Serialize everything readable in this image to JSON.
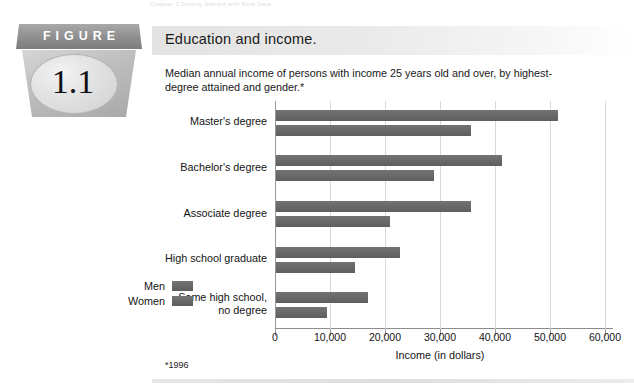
{
  "running_head": "Chapter 1  Getting Started with Real Data",
  "figure_badge": {
    "banner_label": "FIGURE",
    "number": "1.1"
  },
  "title_bar": {
    "title": "Education and income."
  },
  "caption": "Median annual income of persons with income 25 years old and over, by highest-degree attained and gender.*",
  "footnote": "*1996",
  "legend": {
    "items": [
      {
        "label": "Men",
        "color": "#6a6a6a"
      },
      {
        "label": "Women",
        "color": "#6a6a6a"
      }
    ]
  },
  "chart_data": {
    "type": "bar",
    "orientation": "horizontal",
    "title": "Education and income.",
    "subtitle": "Median annual income of persons with income 25 years old and over, by highest-degree attained and gender.*",
    "categories": [
      "Master's degree",
      "Bachelor's degree",
      "Associate degree",
      "High school graduate",
      "Some high school, no degree"
    ],
    "category_lines": [
      [
        "Master's degree"
      ],
      [
        "Bachelor's degree"
      ],
      [
        "Associate degree"
      ],
      [
        "High school graduate"
      ],
      [
        "Some high school,",
        "no degree"
      ]
    ],
    "series": [
      {
        "name": "Men",
        "values": [
          51300,
          41000,
          35500,
          22600,
          16700
        ]
      },
      {
        "name": "Women",
        "values": [
          35500,
          28800,
          20800,
          14400,
          9300
        ]
      }
    ],
    "xlabel": "Income (in dollars)",
    "ylabel": "",
    "xlim": [
      0,
      60000
    ],
    "xticks": [
      0,
      10000,
      20000,
      30000,
      40000,
      50000,
      60000
    ],
    "xticklabels": [
      "0",
      "10,000",
      "20,000",
      "30,000",
      "40,000",
      "50,000",
      "60,000"
    ],
    "grid": "vertical",
    "legend_position": "left-outside",
    "bar_color": "#6a6a6a",
    "footnote": "*1996"
  }
}
